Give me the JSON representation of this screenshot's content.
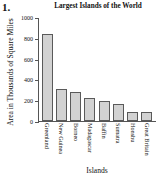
{
  "problem": {
    "number": "1."
  },
  "chart_data": {
    "type": "bar",
    "title": "Largest Islands of the World",
    "xlabel": "Islands",
    "ylabel": "Area in Thousands of Square Miles",
    "categories": [
      "Greenland",
      "New Guinea",
      "Borneo",
      "Madagascar",
      "Baffin",
      "Sumatra",
      "Honshu",
      "Great Britain"
    ],
    "values": [
      840,
      306,
      280,
      227,
      196,
      165,
      88,
      88
    ],
    "ylim": [
      0,
      1000
    ],
    "yticks": [
      0,
      200,
      400,
      600,
      800,
      1000
    ],
    "ytick_labels": [
      "0",
      "200",
      "400",
      "600",
      "800",
      "1000"
    ],
    "grid": false,
    "legend": false,
    "bar_color": "#d2d2d2",
    "bar_edge_color": "#5a5a5a",
    "axis_color": "#555555",
    "background": "#ffffff"
  }
}
